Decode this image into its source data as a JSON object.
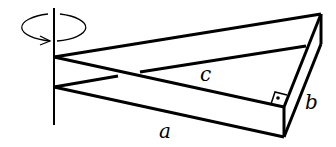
{
  "diagram": {
    "labels": {
      "a": "a",
      "b": "b",
      "c": "c"
    },
    "right_angle_marker": "square-with-dot",
    "rotation_indicator": "ellipse-arrow-around-axis",
    "colors": {
      "stroke": "#000000",
      "background": "#ffffff"
    }
  }
}
